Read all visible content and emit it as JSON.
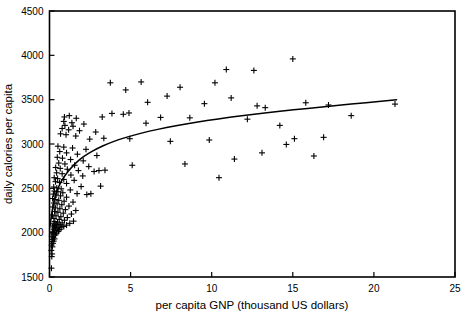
{
  "chart_data": {
    "type": "scatter",
    "title": "",
    "xlabel": "per capita GNP (thousand US dollars)",
    "ylabel": "daily calories per capita",
    "xlim": [
      0,
      25
    ],
    "ylim": [
      1500,
      4500
    ],
    "xticks": [
      0,
      5,
      10,
      15,
      20,
      25
    ],
    "yticks": [
      1500,
      2000,
      2500,
      3000,
      3500,
      4000,
      4500
    ],
    "xticklabels": [
      "0",
      "5",
      "10",
      "15",
      "20",
      "25"
    ],
    "yticklabels": [
      "1500",
      "2000",
      "2500",
      "3000",
      "3500",
      "4000",
      "4500"
    ],
    "grid": false,
    "legend": null,
    "marker": "plus",
    "marker_color": "#000000",
    "frame_color": "#000000",
    "series": [
      {
        "name": "countries",
        "marker": "+",
        "points": [
          [
            0.12,
            1600
          ],
          [
            0.14,
            1730
          ],
          [
            0.16,
            1760
          ],
          [
            0.11,
            1800
          ],
          [
            0.18,
            1840
          ],
          [
            0.13,
            1860
          ],
          [
            0.22,
            1880
          ],
          [
            0.15,
            1900
          ],
          [
            0.26,
            1905
          ],
          [
            0.19,
            1925
          ],
          [
            0.31,
            1930
          ],
          [
            0.24,
            1950
          ],
          [
            0.14,
            1960
          ],
          [
            0.37,
            1975
          ],
          [
            0.21,
            1985
          ],
          [
            0.44,
            1995
          ],
          [
            0.29,
            2000
          ],
          [
            0.17,
            2010
          ],
          [
            0.55,
            2015
          ],
          [
            0.34,
            2025
          ],
          [
            0.63,
            2035
          ],
          [
            0.25,
            2040
          ],
          [
            0.46,
            2050
          ],
          [
            0.72,
            2055
          ],
          [
            0.38,
            2060
          ],
          [
            0.2,
            2065
          ],
          [
            0.88,
            2070
          ],
          [
            0.58,
            2075
          ],
          [
            0.3,
            2080
          ],
          [
            1.05,
            2085
          ],
          [
            0.66,
            2090
          ],
          [
            0.42,
            2095
          ],
          [
            0.23,
            2100
          ],
          [
            1.25,
            2105
          ],
          [
            0.78,
            2110
          ],
          [
            0.5,
            2118
          ],
          [
            0.33,
            2125
          ],
          [
            1.48,
            2130
          ],
          [
            0.92,
            2140
          ],
          [
            0.6,
            2150
          ],
          [
            0.27,
            2160
          ],
          [
            1.1,
            2170
          ],
          [
            0.7,
            2180
          ],
          [
            0.4,
            2190
          ],
          [
            0.18,
            2200
          ],
          [
            1.35,
            2210
          ],
          [
            0.85,
            2220
          ],
          [
            0.52,
            2230
          ],
          [
            0.31,
            2240
          ],
          [
            1.62,
            2250
          ],
          [
            0.98,
            2260
          ],
          [
            0.64,
            2270
          ],
          [
            0.36,
            2280
          ],
          [
            0.21,
            2290
          ],
          [
            1.2,
            2300
          ],
          [
            0.76,
            2315
          ],
          [
            0.47,
            2325
          ],
          [
            0.28,
            2335
          ],
          [
            1.45,
            2345
          ],
          [
            0.9,
            2355
          ],
          [
            0.57,
            2365
          ],
          [
            0.34,
            2375
          ],
          [
            0.19,
            2385
          ],
          [
            1.05,
            2400
          ],
          [
            0.68,
            2415
          ],
          [
            0.41,
            2425
          ],
          [
            0.24,
            2435
          ],
          [
            1.7,
            2440
          ],
          [
            0.82,
            2450
          ],
          [
            0.52,
            2462
          ],
          [
            0.3,
            2470
          ],
          [
            1.28,
            2482
          ],
          [
            0.72,
            2495
          ],
          [
            0.45,
            2505
          ],
          [
            0.26,
            2515
          ],
          [
            2.3,
            2430
          ],
          [
            2.55,
            2440
          ],
          [
            3.15,
            2525
          ],
          [
            1.95,
            2520
          ],
          [
            1.05,
            2555
          ],
          [
            0.62,
            2565
          ],
          [
            0.37,
            2575
          ],
          [
            1.52,
            2590
          ],
          [
            0.88,
            2600
          ],
          [
            0.5,
            2610
          ],
          [
            0.29,
            2620
          ],
          [
            2.05,
            2640
          ],
          [
            1.32,
            2650
          ],
          [
            0.78,
            2665
          ],
          [
            0.44,
            2675
          ],
          [
            2.75,
            2690
          ],
          [
            1.78,
            2700
          ],
          [
            1.1,
            2715
          ],
          [
            0.66,
            2725
          ],
          [
            0.38,
            2735
          ],
          [
            3.05,
            2700
          ],
          [
            3.42,
            2705
          ],
          [
            2.42,
            2745
          ],
          [
            1.55,
            2760
          ],
          [
            0.95,
            2775
          ],
          [
            0.57,
            2785
          ],
          [
            5.1,
            2760
          ],
          [
            8.35,
            2775
          ],
          [
            10.45,
            2620
          ],
          [
            2.08,
            2810
          ],
          [
            1.3,
            2825
          ],
          [
            0.8,
            2840
          ],
          [
            0.48,
            2850
          ],
          [
            2.92,
            2870
          ],
          [
            1.72,
            2885
          ],
          [
            1.05,
            2900
          ],
          [
            0.63,
            2915
          ],
          [
            2.25,
            2940
          ],
          [
            1.42,
            2955
          ],
          [
            0.88,
            2965
          ],
          [
            0.52,
            2975
          ],
          [
            13.1,
            2900
          ],
          [
            11.4,
            2830
          ],
          [
            16.3,
            2865
          ],
          [
            14.6,
            2995
          ],
          [
            9.85,
            3045
          ],
          [
            7.45,
            3030
          ],
          [
            4.95,
            3060
          ],
          [
            3.35,
            3065
          ],
          [
            2.48,
            3055
          ],
          [
            1.62,
            3090
          ],
          [
            1.02,
            3105
          ],
          [
            0.68,
            3115
          ],
          [
            2.85,
            3135
          ],
          [
            1.85,
            3150
          ],
          [
            1.18,
            3160
          ],
          [
            0.78,
            3175
          ],
          [
            1.45,
            3200
          ],
          [
            0.95,
            3210
          ],
          [
            2.12,
            3225
          ],
          [
            1.38,
            3240
          ],
          [
            0.88,
            3255
          ],
          [
            16.9,
            3075
          ],
          [
            15.1,
            3060
          ],
          [
            14.2,
            3210
          ],
          [
            12.2,
            3280
          ],
          [
            8.65,
            3295
          ],
          [
            6.85,
            3300
          ],
          [
            5.95,
            3235
          ],
          [
            4.55,
            3335
          ],
          [
            4.9,
            3350
          ],
          [
            3.85,
            3345
          ],
          [
            3.25,
            3305
          ],
          [
            1.65,
            3290
          ],
          [
            1.22,
            3320
          ],
          [
            0.92,
            3305
          ],
          [
            18.6,
            3320
          ],
          [
            17.2,
            3440
          ],
          [
            15.8,
            3465
          ],
          [
            21.3,
            3450
          ],
          [
            13.3,
            3410
          ],
          [
            12.8,
            3430
          ],
          [
            11.2,
            3520
          ],
          [
            9.55,
            3455
          ],
          [
            7.25,
            3540
          ],
          [
            6.05,
            3470
          ],
          [
            4.7,
            3610
          ],
          [
            3.75,
            3690
          ],
          [
            5.65,
            3700
          ],
          [
            10.2,
            3690
          ],
          [
            15.0,
            3960
          ],
          [
            12.6,
            3830
          ],
          [
            10.9,
            3840
          ],
          [
            8.05,
            3640
          ]
        ]
      }
    ],
    "fit_curve": {
      "name": "logarithmic fit",
      "style": "solid",
      "points": [
        [
          0.05,
          2085
        ],
        [
          0.1,
          2170
        ],
        [
          0.18,
          2265
        ],
        [
          0.28,
          2360
        ],
        [
          0.42,
          2450
        ],
        [
          0.6,
          2535
        ],
        [
          0.82,
          2610
        ],
        [
          1.1,
          2680
        ],
        [
          1.45,
          2755
        ],
        [
          1.85,
          2825
        ],
        [
          2.35,
          2890
        ],
        [
          2.95,
          2950
        ],
        [
          3.6,
          3005
        ],
        [
          4.35,
          3055
        ],
        [
          5.2,
          3100
        ],
        [
          6.15,
          3145
        ],
        [
          7.2,
          3185
        ],
        [
          8.4,
          3225
        ],
        [
          9.7,
          3265
        ],
        [
          11.1,
          3300
        ],
        [
          12.6,
          3335
        ],
        [
          14.2,
          3370
        ],
        [
          15.9,
          3400
        ],
        [
          17.7,
          3435
        ],
        [
          19.5,
          3465
        ],
        [
          21.4,
          3500
        ]
      ]
    }
  },
  "axes": {
    "x_axis_name": "x-axis",
    "y_axis_name": "y-axis"
  }
}
